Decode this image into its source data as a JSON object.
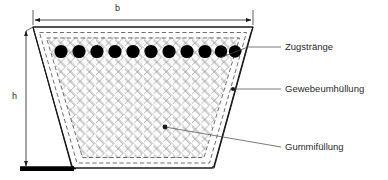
{
  "figure": {
    "dimensions": {
      "width_label": "b",
      "height_label": "h"
    },
    "callouts": [
      {
        "id": "zugstraenge",
        "label": "Zugstränge"
      },
      {
        "id": "gewebeumhuellung",
        "label": "Gewebeumhüllung"
      },
      {
        "id": "gummifuellung",
        "label": "Gummifüllung"
      }
    ],
    "cords": {
      "count": 11,
      "color": "#000000"
    },
    "colors": {
      "outline": "#1a1a1a",
      "dashed_outline": "#555555",
      "mesh": "#9a9a9a",
      "datum_bar": "#000000",
      "text": "#2b2b2b",
      "leader": "#4d4d4d",
      "background": "#ffffff"
    }
  }
}
